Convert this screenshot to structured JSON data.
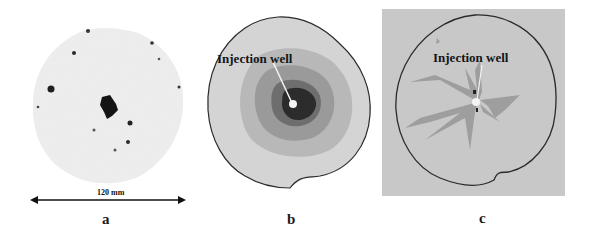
{
  "figure": {
    "panels": [
      {
        "id": "a",
        "caption": "a",
        "description": "Photograph of core sample cross-section",
        "scale_bar": {
          "label": "120 mm"
        }
      },
      {
        "id": "b",
        "caption": "b",
        "description": "Simulated concentric saturation distribution",
        "annotation": "Injection well"
      },
      {
        "id": "c",
        "caption": "c",
        "description": "Simulated fingering saturation pattern",
        "annotation": "Injection well"
      }
    ],
    "colors": {
      "background": "#ffffff",
      "panel_c_background": "#c8c8c8",
      "outline": "#2a2a2a",
      "core_dark": "#1a1a1a",
      "zone_light": "#d2d2d2",
      "zone_mid": "#a8a8a8",
      "zone_dark": "#787878",
      "zone_core": "#2c2c2c",
      "well_marker": "#f4f4f4"
    }
  }
}
